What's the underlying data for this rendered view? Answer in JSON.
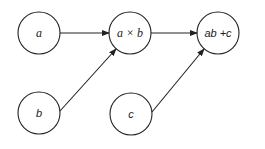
{
  "diagram": {
    "type": "computation-graph",
    "nodes": [
      {
        "id": "a",
        "label": "a",
        "cx": 39,
        "cy": 33
      },
      {
        "id": "axb",
        "label": "a × b",
        "cx": 130,
        "cy": 33
      },
      {
        "id": "abc",
        "label": "ab +c",
        "cx": 218,
        "cy": 33
      },
      {
        "id": "b",
        "label": "b",
        "cx": 39,
        "cy": 113
      },
      {
        "id": "c",
        "label": "c",
        "cx": 131,
        "cy": 114
      }
    ],
    "edges": [
      {
        "from": "a",
        "to": "axb"
      },
      {
        "from": "b",
        "to": "axb"
      },
      {
        "from": "axb",
        "to": "abc"
      },
      {
        "from": "c",
        "to": "abc"
      }
    ],
    "stroke_color": "#222222",
    "background": "#ffffff"
  }
}
